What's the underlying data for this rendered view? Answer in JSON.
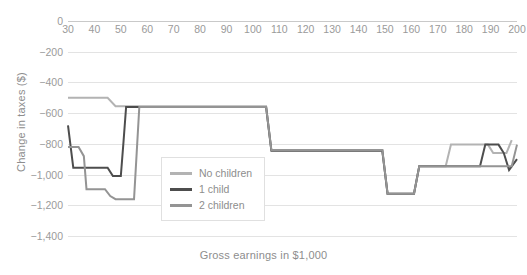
{
  "chart_data": {
    "type": "line",
    "title": "",
    "xlabel": "Gross earnings in $1,000",
    "ylabel": "Change in taxes ($)",
    "xlim": [
      30,
      200
    ],
    "ylim": [
      -1400,
      0
    ],
    "xticks": [
      30,
      40,
      50,
      60,
      70,
      80,
      90,
      100,
      110,
      120,
      130,
      140,
      150,
      160,
      170,
      180,
      190,
      200
    ],
    "yticks": [
      0,
      -200,
      -400,
      -600,
      -800,
      -1000,
      -1200,
      -1400
    ],
    "ytick_labels": [
      "0",
      "−200",
      "−400",
      "−600",
      "−800",
      "−1,000",
      "−1,200",
      "−1,400"
    ],
    "xtick_labels": [
      "30",
      "40",
      "50",
      "60",
      "70",
      "80",
      "90",
      "100",
      "110",
      "120",
      "130",
      "140",
      "150",
      "160",
      "170",
      "180",
      "190",
      "200"
    ],
    "grid": "horizontal",
    "legend_position": "center-left",
    "series": [
      {
        "name": "No children",
        "color": "#b3b3b3",
        "points": [
          [
            30,
            -500
          ],
          [
            45,
            -500
          ],
          [
            48,
            -555
          ],
          [
            56,
            -555
          ],
          [
            105,
            -555
          ],
          [
            107,
            -840
          ],
          [
            149,
            -840
          ],
          [
            151,
            -1125
          ],
          [
            161,
            -1125
          ],
          [
            163,
            -945
          ],
          [
            173,
            -945
          ],
          [
            175,
            -805
          ],
          [
            186,
            -805
          ],
          [
            189,
            -805
          ],
          [
            191,
            -860
          ],
          [
            196,
            -860
          ],
          [
            198,
            -775
          ]
        ]
      },
      {
        "name": "1 child",
        "color": "#4d4d4d",
        "points": [
          [
            30,
            -680
          ],
          [
            32,
            -955
          ],
          [
            45,
            -955
          ],
          [
            47,
            -1010
          ],
          [
            50,
            -1010
          ],
          [
            51,
            -790
          ],
          [
            52,
            -560
          ],
          [
            56,
            -560
          ],
          [
            105,
            -560
          ],
          [
            107,
            -845
          ],
          [
            149,
            -845
          ],
          [
            151,
            -1125
          ],
          [
            161,
            -1125
          ],
          [
            163,
            -945
          ],
          [
            186,
            -945
          ],
          [
            188,
            -805
          ],
          [
            193,
            -805
          ],
          [
            195,
            -860
          ],
          [
            197,
            -970
          ],
          [
            200,
            -900
          ]
        ]
      },
      {
        "name": "2 children",
        "color": "#949494",
        "points": [
          [
            30,
            -820
          ],
          [
            34,
            -820
          ],
          [
            36,
            -880
          ],
          [
            37,
            -1095
          ],
          [
            44,
            -1095
          ],
          [
            46,
            -1140
          ],
          [
            48,
            -1160
          ],
          [
            55,
            -1160
          ],
          [
            56,
            -860
          ],
          [
            57,
            -560
          ],
          [
            105,
            -560
          ],
          [
            107,
            -840
          ],
          [
            149,
            -840
          ],
          [
            151,
            -1125
          ],
          [
            161,
            -1125
          ],
          [
            163,
            -945
          ],
          [
            196,
            -945
          ],
          [
            198,
            -945
          ],
          [
            200,
            -805
          ]
        ]
      }
    ]
  },
  "legend": {
    "entries": [
      {
        "label": "No children",
        "color": "#b3b3b3"
      },
      {
        "label": "1 child",
        "color": "#4d4d4d"
      },
      {
        "label": "2 children",
        "color": "#949494"
      }
    ]
  },
  "colors": {
    "gridline": "#e3e3e3",
    "zero_line": "#c9c9c9",
    "tick_text": "#9a9a9a",
    "axis_title": "#8d8d8d",
    "background": "#ffffff"
  }
}
